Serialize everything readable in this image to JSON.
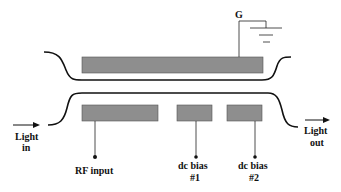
{
  "diagram": {
    "type": "electro-optic modulator schematic",
    "labels": {
      "ground": "G",
      "light_in_1": "Light",
      "light_in_2": "in",
      "light_out_1": "Light",
      "light_out_2": "out",
      "rf_input": "RF input",
      "dc_bias_1_line1": "dc bias",
      "dc_bias_1_line2": "#1",
      "dc_bias_2_line1": "dc bias",
      "dc_bias_2_line2": "#2"
    },
    "colors": {
      "electrode": "#8e8e8e",
      "waveguide": "#111111",
      "background": "#ffffff"
    }
  }
}
